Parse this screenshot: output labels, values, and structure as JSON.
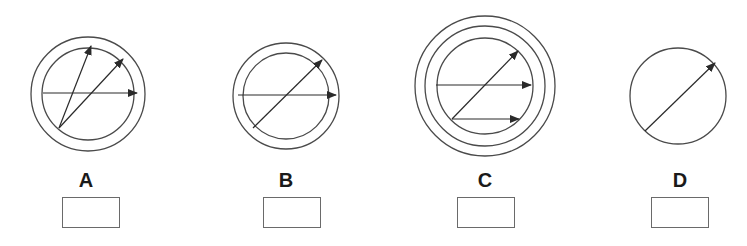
{
  "figures": [
    {
      "label": "A",
      "circles": [
        {
          "cx": 88,
          "cy": 94,
          "r": 57
        },
        {
          "cx": 88,
          "cy": 94,
          "r": 46
        }
      ],
      "arrows": [
        {
          "x1": 59,
          "y1": 128,
          "x2": 91,
          "y2": 46
        },
        {
          "x1": 59,
          "y1": 128,
          "x2": 123,
          "y2": 59
        },
        {
          "x1": 43,
          "y1": 93,
          "x2": 137,
          "y2": 93
        }
      ],
      "label_pos": {
        "x": 66,
        "y": 169
      },
      "box_pos": {
        "x": 62,
        "y": 197
      }
    },
    {
      "label": "B",
      "circles": [
        {
          "cx": 286,
          "cy": 96,
          "r": 53
        },
        {
          "cx": 286,
          "cy": 96,
          "r": 43
        }
      ],
      "arrows": [
        {
          "x1": 238,
          "y1": 95,
          "x2": 336,
          "y2": 95
        },
        {
          "x1": 253,
          "y1": 128,
          "x2": 322,
          "y2": 60
        }
      ],
      "label_pos": {
        "x": 266,
        "y": 169
      },
      "box_pos": {
        "x": 263,
        "y": 197
      }
    },
    {
      "label": "C",
      "circles": [
        {
          "cx": 485,
          "cy": 86,
          "r": 70
        },
        {
          "cx": 485,
          "cy": 86,
          "r": 60
        },
        {
          "cx": 485,
          "cy": 86,
          "r": 48
        }
      ],
      "arrows": [
        {
          "x1": 436,
          "y1": 85,
          "x2": 531,
          "y2": 85
        },
        {
          "x1": 452,
          "y1": 119,
          "x2": 518,
          "y2": 51
        },
        {
          "x1": 452,
          "y1": 119,
          "x2": 519,
          "y2": 119
        }
      ],
      "label_pos": {
        "x": 465,
        "y": 169
      },
      "box_pos": {
        "x": 457,
        "y": 197
      }
    },
    {
      "label": "D",
      "circles": [
        {
          "cx": 678,
          "cy": 96,
          "r": 48
        }
      ],
      "arrows": [
        {
          "x1": 645,
          "y1": 131,
          "x2": 715,
          "y2": 63
        }
      ],
      "label_pos": {
        "x": 660,
        "y": 169
      },
      "box_pos": {
        "x": 651,
        "y": 197
      }
    }
  ],
  "colors": {
    "stroke": "#4a4a4a",
    "arrow": "#2a2a2a",
    "label": "#1a1a1a",
    "box_border": "#6a6a6a",
    "background": "#ffffff"
  }
}
